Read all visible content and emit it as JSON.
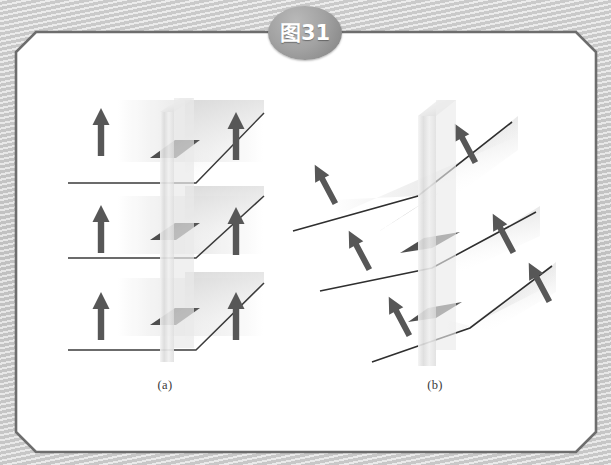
{
  "figure": {
    "badge_label": "图31",
    "badge_color": "#9a9a9a",
    "panel_border_color": "#6d6d6d",
    "panel_fill": "#ffffff",
    "caption_a": "(a)",
    "caption_b": "(b)"
  },
  "diagram_a": {
    "name": "horizontal-layers-vertical-magnetization",
    "panel_count": 3,
    "arrow_color": "#575757",
    "slab_color": "#e2e2e2",
    "dark_parallelogram_color": "#4a4a4a",
    "layers": [
      {
        "index": 1,
        "left_arrow_angle_deg": 0,
        "right_arrow_angle_deg": 0,
        "baseline_y": 183
      },
      {
        "index": 2,
        "left_arrow_angle_deg": 0,
        "right_arrow_angle_deg": 0,
        "baseline_y": 258
      },
      {
        "index": 3,
        "left_arrow_angle_deg": 0,
        "right_arrow_angle_deg": 0,
        "baseline_y": 350
      }
    ]
  },
  "diagram_b": {
    "name": "tilted-layers-canted-magnetization",
    "panel_count": 3,
    "arrow_color": "#575757",
    "slab_color": "#e2e2e2",
    "dark_parallelogram_color": "#4a4a4a",
    "layers": [
      {
        "index": 1,
        "left_arrow_angle_deg": 35,
        "right_arrow_angle_deg": 35
      },
      {
        "index": 2,
        "left_arrow_angle_deg": 35,
        "right_arrow_angle_deg": 35
      },
      {
        "index": 3,
        "left_arrow_angle_deg": 35,
        "right_arrow_angle_deg": 35
      }
    ]
  }
}
